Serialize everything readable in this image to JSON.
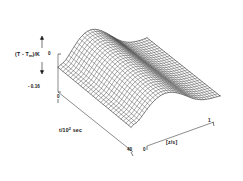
{
  "figure": {
    "kind": "3d-wireframe-surface",
    "background": "#ffffff",
    "ink": "#111111"
  },
  "axes": {
    "vertical": {
      "label": "(T - T",
      "label_sub": "m",
      "label_tail": ")/K",
      "tick_top": "0",
      "tick_bottom": "- 0.16",
      "range": [
        -0.16,
        0
      ]
    },
    "depth": {
      "label_lead": "t/10",
      "label_sup": "2",
      "label_tail": "sec",
      "tick_near": "0",
      "tick_far": "40",
      "range": [
        0,
        40
      ]
    },
    "horizontal": {
      "label": "[z/s]",
      "tick_left": "0",
      "tick_right": "1",
      "range": [
        0,
        1
      ]
    }
  },
  "chart_data": {
    "type": "surface",
    "title": "",
    "xlabel": "[z/s]",
    "ylabel": "t/10^2 sec",
    "zlabel": "(T - Tm)/K",
    "xlim": [
      0,
      1
    ],
    "ylim": [
      0,
      40
    ],
    "zlim": [
      -0.16,
      0
    ],
    "grid": false,
    "legend": "none",
    "x": [
      0.0,
      0.0625,
      0.125,
      0.1875,
      0.25,
      0.3125,
      0.375,
      0.4375,
      0.5,
      0.5625,
      0.625,
      0.6875,
      0.75,
      0.8125,
      0.875,
      0.9375,
      1.0
    ],
    "y": [
      0,
      2.5,
      5,
      7.5,
      10,
      12.5,
      15,
      17.5,
      20,
      22.5,
      25,
      27.5,
      30,
      32.5,
      35,
      37.5,
      40
    ],
    "z_note": "Surface dips to a trough near the mid-left then rises to a plateau at large z; deepest values near -0.16 K at early time and intermediate z.",
    "z": [
      [
        0.0,
        -0.02,
        -0.05,
        -0.08,
        -0.11,
        -0.13,
        -0.145,
        -0.15,
        -0.148,
        -0.14,
        -0.125,
        -0.1,
        -0.075,
        -0.05,
        -0.03,
        -0.012,
        0.0
      ],
      [
        0.0,
        -0.021,
        -0.052,
        -0.083,
        -0.112,
        -0.132,
        -0.146,
        -0.151,
        -0.149,
        -0.141,
        -0.126,
        -0.101,
        -0.076,
        -0.051,
        -0.031,
        -0.013,
        0.0
      ],
      [
        0.0,
        -0.023,
        -0.055,
        -0.086,
        -0.114,
        -0.134,
        -0.148,
        -0.152,
        -0.15,
        -0.142,
        -0.127,
        -0.103,
        -0.078,
        -0.053,
        -0.032,
        -0.014,
        0.0
      ],
      [
        0.0,
        -0.025,
        -0.058,
        -0.089,
        -0.116,
        -0.136,
        -0.149,
        -0.153,
        -0.151,
        -0.143,
        -0.128,
        -0.104,
        -0.079,
        -0.054,
        -0.033,
        -0.015,
        0.0
      ],
      [
        0.0,
        -0.027,
        -0.06,
        -0.091,
        -0.118,
        -0.137,
        -0.15,
        -0.154,
        -0.152,
        -0.144,
        -0.129,
        -0.105,
        -0.08,
        -0.055,
        -0.034,
        -0.016,
        0.0
      ],
      [
        0.0,
        -0.028,
        -0.062,
        -0.093,
        -0.119,
        -0.138,
        -0.15,
        -0.154,
        -0.152,
        -0.144,
        -0.13,
        -0.106,
        -0.081,
        -0.056,
        -0.035,
        -0.016,
        0.0
      ],
      [
        0.0,
        -0.029,
        -0.063,
        -0.094,
        -0.12,
        -0.139,
        -0.151,
        -0.155,
        -0.153,
        -0.145,
        -0.13,
        -0.106,
        -0.081,
        -0.056,
        -0.035,
        -0.017,
        0.0
      ],
      [
        0.0,
        -0.03,
        -0.064,
        -0.095,
        -0.121,
        -0.139,
        -0.151,
        -0.155,
        -0.153,
        -0.145,
        -0.131,
        -0.107,
        -0.082,
        -0.057,
        -0.036,
        -0.017,
        0.0
      ],
      [
        0.0,
        -0.031,
        -0.065,
        -0.096,
        -0.121,
        -0.14,
        -0.152,
        -0.156,
        -0.154,
        -0.146,
        -0.131,
        -0.107,
        -0.082,
        -0.057,
        -0.036,
        -0.017,
        0.0
      ],
      [
        0.0,
        -0.031,
        -0.066,
        -0.096,
        -0.122,
        -0.14,
        -0.152,
        -0.156,
        -0.154,
        -0.146,
        -0.132,
        -0.108,
        -0.083,
        -0.058,
        -0.037,
        -0.018,
        0.0
      ],
      [
        0.0,
        -0.032,
        -0.066,
        -0.097,
        -0.122,
        -0.141,
        -0.152,
        -0.156,
        -0.154,
        -0.146,
        -0.132,
        -0.108,
        -0.083,
        -0.058,
        -0.037,
        -0.018,
        0.0
      ],
      [
        0.0,
        -0.032,
        -0.067,
        -0.097,
        -0.123,
        -0.141,
        -0.153,
        -0.157,
        -0.155,
        -0.147,
        -0.132,
        -0.108,
        -0.083,
        -0.058,
        -0.037,
        -0.018,
        0.0
      ],
      [
        0.0,
        -0.033,
        -0.067,
        -0.098,
        -0.123,
        -0.141,
        -0.153,
        -0.157,
        -0.155,
        -0.147,
        -0.133,
        -0.109,
        -0.084,
        -0.059,
        -0.038,
        -0.018,
        0.0
      ],
      [
        0.0,
        -0.033,
        -0.068,
        -0.098,
        -0.123,
        -0.142,
        -0.153,
        -0.157,
        -0.155,
        -0.147,
        -0.133,
        -0.109,
        -0.084,
        -0.059,
        -0.038,
        -0.019,
        0.0
      ],
      [
        0.0,
        -0.033,
        -0.068,
        -0.098,
        -0.124,
        -0.142,
        -0.153,
        -0.157,
        -0.155,
        -0.147,
        -0.133,
        -0.109,
        -0.084,
        -0.059,
        -0.038,
        -0.019,
        0.0
      ],
      [
        0.0,
        -0.034,
        -0.068,
        -0.099,
        -0.124,
        -0.142,
        -0.154,
        -0.158,
        -0.156,
        -0.148,
        -0.133,
        -0.109,
        -0.084,
        -0.059,
        -0.038,
        -0.019,
        0.0
      ],
      [
        0.0,
        -0.034,
        -0.069,
        -0.099,
        -0.124,
        -0.142,
        -0.154,
        -0.158,
        -0.156,
        -0.148,
        -0.134,
        -0.11,
        -0.085,
        -0.06,
        -0.039,
        -0.019,
        0.0
      ]
    ]
  }
}
